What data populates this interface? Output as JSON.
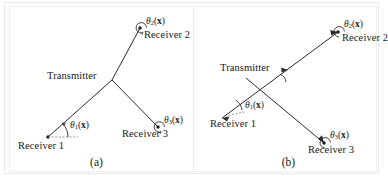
{
  "figure": {
    "background": "#ffffff",
    "ink_color": "#2b2b2b",
    "type": "technical-diagram"
  },
  "panels": [
    {
      "id": "a",
      "caption": "(a)",
      "transmitter_label": "Transmitter",
      "nodes": [
        {
          "name": "receiver-1",
          "label": "Receiver 1",
          "angle_label": "theta-1"
        },
        {
          "name": "receiver-2",
          "label": "Receiver 2",
          "angle_label": "theta-2"
        },
        {
          "name": "receiver-3",
          "label": "Receiver 3",
          "angle_label": "theta-3"
        }
      ],
      "angles": [
        {
          "symbol": "θ",
          "subscript": "1",
          "argument": "x"
        },
        {
          "symbol": "θ",
          "subscript": "2",
          "argument": "x"
        },
        {
          "symbol": "θ",
          "subscript": "3",
          "argument": "x"
        }
      ]
    },
    {
      "id": "b",
      "caption": "(b)",
      "transmitter_label": "Transmitter",
      "nodes": [
        {
          "name": "receiver-1",
          "label": "Receiver 1",
          "angle_label": "theta-1"
        },
        {
          "name": "receiver-2",
          "label": "Receiver 2",
          "angle_label": "theta-2"
        },
        {
          "name": "receiver-3",
          "label": "Receiver 3",
          "angle_label": "theta-3"
        }
      ],
      "angles": [
        {
          "symbol": "θ",
          "subscript": "1",
          "argument": "x"
        },
        {
          "symbol": "θ",
          "subscript": "2",
          "argument": "x"
        },
        {
          "symbol": "θ",
          "subscript": "3",
          "argument": "x"
        }
      ]
    }
  ],
  "labels": {
    "transmitter": "Transmitter",
    "receiver_1": "Receiver 1",
    "receiver_2": "Receiver 2",
    "receiver_3": "Receiver 3",
    "caption_a": "(a)",
    "caption_b": "(b)",
    "theta": "θ",
    "sub_1": "1",
    "sub_2": "2",
    "sub_3": "3",
    "open_paren": "(",
    "close_paren": ")",
    "vector_x": "x"
  }
}
